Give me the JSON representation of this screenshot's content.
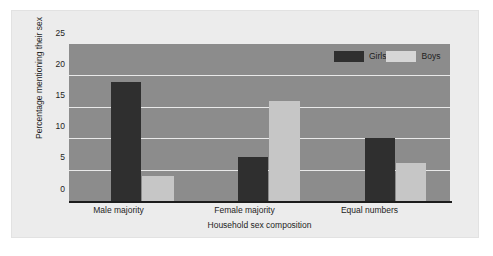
{
  "chart_data": {
    "type": "bar",
    "title": "",
    "xlabel": "Household sex composition",
    "ylabel": "Percentage mentioning their sex",
    "categories": [
      "Male majority",
      "Female majority",
      "Equal numbers"
    ],
    "series": [
      {
        "name": "Girls",
        "color": "#2f2f2f",
        "values": [
          19,
          7,
          10
        ]
      },
      {
        "name": "Boys",
        "color": "#c6c6c6",
        "values": [
          4,
          16,
          6
        ]
      }
    ],
    "ylim": [
      0,
      25
    ],
    "yticks": [
      0,
      5,
      10,
      15,
      20,
      25
    ],
    "ytick_labels": [
      "0",
      "5",
      "10",
      "15",
      "20",
      "25"
    ],
    "grid": true,
    "gridlines_at": [
      5,
      10,
      15,
      20
    ],
    "legend_position": "top-right",
    "plot_background": "#8c8c8c",
    "figure_background": "#ececec",
    "gridline_color": "#e9e9e9",
    "axis_color": "#1c1c1c"
  }
}
